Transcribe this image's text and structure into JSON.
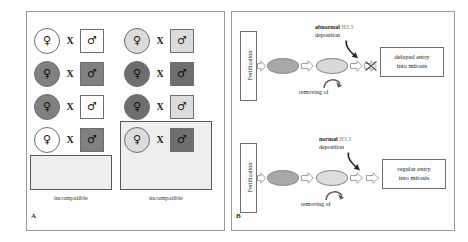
{
  "figure": {
    "panels": [
      {
        "letter": "A",
        "name": "crossing-scheme"
      },
      {
        "letter": "B",
        "name": "fertilization-flow"
      }
    ]
  },
  "panelA": {
    "letter": "A",
    "female_glyph": "♀",
    "male_glyph": "♂",
    "x_symbol": "X",
    "columns": [
      {
        "name": "left-column",
        "label": "incompatible",
        "rows": [
          {
            "female_color": "#ffffff",
            "male_color": "#ffffff",
            "highlighted": false
          },
          {
            "female_color": "#808080",
            "male_color": "#808080",
            "highlighted": false
          },
          {
            "female_color": "#808080",
            "male_color": "#ffffff",
            "highlighted": false
          },
          {
            "female_color": "#ffffff",
            "male_color": "#808080",
            "highlighted": true
          }
        ]
      },
      {
        "name": "right-column",
        "label": "incompatible",
        "rows": [
          {
            "female_color": "#dcdcdc",
            "male_color": "#dcdcdc",
            "highlighted": false
          },
          {
            "female_color": "#6e6e6e",
            "male_color": "#6e6e6e",
            "highlighted": false
          },
          {
            "female_color": "#6e6e6e",
            "male_color": "#dcdcdc",
            "highlighted": true
          },
          {
            "female_color": "#dcdcdc",
            "male_color": "#6e6e6e",
            "highlighted": true
          }
        ]
      }
    ]
  },
  "panelB": {
    "letter": "B",
    "flows": [
      {
        "name": "abnormal-flow",
        "start_label": "Fertilization",
        "deposition_bold": "abnormal",
        "deposition_gene": "H3.3",
        "deposition_word": "deposition",
        "removing_label": "removing of",
        "removing_target": "",
        "has_block": true,
        "outcome_line1": "delayed entry",
        "outcome_line2": "into mitosis"
      },
      {
        "name": "normal-flow",
        "start_label": "Fertilization",
        "deposition_bold": "normal",
        "deposition_gene": "H3.3",
        "deposition_word": "deposition",
        "removing_label": "removing of",
        "removing_target": "",
        "has_block": false,
        "outcome_line1": "regular entry",
        "outcome_line2": "into mitosis"
      }
    ]
  },
  "colors": {
    "frame": "#9a9a9a",
    "stroke": "#6d6d6d",
    "highlight_fill": "#eeeeee",
    "dark_fill": "#6e6e6e",
    "light_fill": "#dcdcdc",
    "white_fill": "#ffffff"
  }
}
